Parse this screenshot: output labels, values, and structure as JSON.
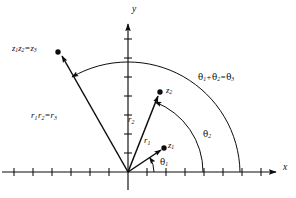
{
  "figure": {
    "background_color": "#ffffff",
    "stroke_color": "#0d0d0d",
    "axes": {
      "x_label": "x",
      "y_label": "y",
      "origin_px": [
        128,
        172
      ],
      "x_axis_from_px": [
        2,
        172
      ],
      "x_axis_to_px": [
        278,
        172
      ],
      "y_axis_from_px": [
        128,
        190
      ],
      "y_axis_to_px": [
        128,
        22
      ],
      "x_tick_spacing_px": 19,
      "y_tick_spacing_px": 19,
      "tick_half_length_px": 4
    },
    "points": [
      {
        "name": "z1",
        "label": "z₁",
        "px": [
          163,
          148
        ],
        "dot_radius_px": 2.6
      },
      {
        "name": "z2",
        "label": "z₂",
        "px": [
          159,
          92
        ],
        "dot_radius_px": 2.6
      },
      {
        "name": "z3",
        "label": "z₁z₂ = z₃",
        "px": [
          58,
          52
        ],
        "dot_radius_px": 2.6
      }
    ],
    "vectors": [
      {
        "name": "vector-z1",
        "from_px": [
          128,
          172
        ],
        "to_px": [
          161,
          150
        ],
        "label": "r₁"
      },
      {
        "name": "vector-z2",
        "from_px": [
          128,
          172
        ],
        "to_px": [
          157,
          95
        ],
        "label": "r₂"
      },
      {
        "name": "vector-z3",
        "from_px": [
          128,
          172
        ],
        "to_px": [
          61,
          55
        ],
        "label": "r₁r₂ = r₃"
      }
    ],
    "arcs": [
      {
        "name": "arc-theta2",
        "radius_px": 75,
        "from_angle_deg": 0,
        "to_angle_deg": 69,
        "arrow_at": "end",
        "label": "θ₂"
      },
      {
        "name": "arc-theta-sum",
        "radius_px": 112,
        "from_angle_deg": 0,
        "to_angle_deg": 120,
        "arrow_at": "end",
        "label": "θ₁ + θ₂ = θ₃"
      }
    ],
    "angle_marks": [
      {
        "name": "angle-theta1",
        "label": "θ₁",
        "radius_px": 26,
        "from_angle_deg": 0,
        "to_angle_deg": 34
      }
    ],
    "labels": {
      "axis_x": "x",
      "axis_y": "y",
      "z1": {
        "base": "z",
        "sub": "1"
      },
      "z2": {
        "base": "z",
        "sub": "2"
      },
      "z3_equation": {
        "a": "z",
        "a_sub": "1",
        "b": "z",
        "b_sub": "2",
        "op": "=",
        "c": "z",
        "c_sub": "3"
      },
      "r1": {
        "base": "r",
        "sub": "1"
      },
      "r2": {
        "base": "r",
        "sub": "2"
      },
      "r_equation": {
        "a": "r",
        "a_sub": "1",
        "b": "r",
        "b_sub": "2",
        "op": "=",
        "c": "r",
        "c_sub": "3"
      },
      "theta1": {
        "base": "θ",
        "sub": "1"
      },
      "theta2": {
        "base": "θ",
        "sub": "2"
      },
      "theta_equation": {
        "a": "θ",
        "a_sub": "1",
        "plus": "+",
        "b": "θ",
        "b_sub": "2",
        "op": "=",
        "c": "θ",
        "c_sub": "3"
      }
    }
  }
}
